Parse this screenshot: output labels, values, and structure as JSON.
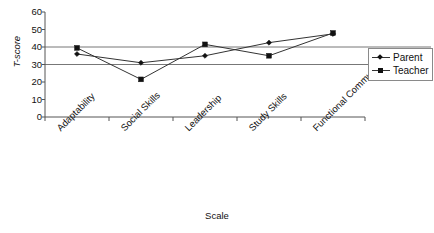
{
  "chart_data": {
    "type": "line",
    "title": "",
    "xlabel": "Scale",
    "ylabel": "T-score",
    "categories": [
      "Adaptability",
      "Social Skills",
      "Leadership",
      "Study Skills",
      "Functional Communication"
    ],
    "series": [
      {
        "name": "Parent",
        "marker": "diamond",
        "values": [
          36,
          31,
          35,
          42.5,
          47.5
        ]
      },
      {
        "name": "Teacher",
        "marker": "square",
        "values": [
          39.5,
          21.5,
          41.5,
          35,
          48
        ]
      }
    ],
    "ylim": [
      0,
      60
    ],
    "yticks": [
      0,
      10,
      20,
      30,
      40,
      50,
      60
    ],
    "ytick_labels": [
      "0",
      "10",
      "20",
      "30",
      "40",
      "50",
      "60"
    ],
    "reference_lines": [
      40,
      30
    ],
    "grid": false,
    "legend_position": "right",
    "line_color": "#333333",
    "reference_line_color": "#777777",
    "axis_color": "#555555"
  },
  "legend": {
    "items": [
      {
        "label": "Parent"
      },
      {
        "label": "Teacher"
      }
    ]
  }
}
